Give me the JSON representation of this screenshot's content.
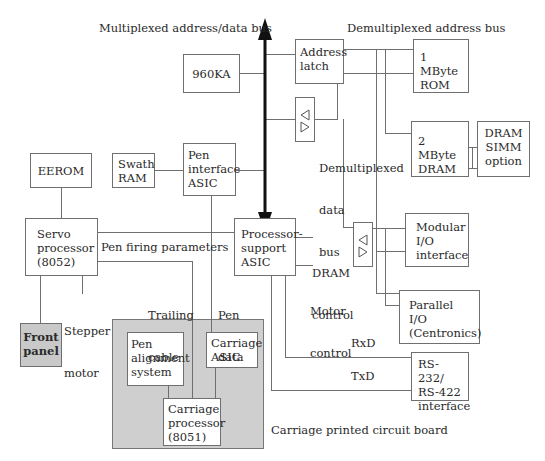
{
  "labels": {
    "mux_bus": "Multiplexed address/data bus",
    "demux_addr_bus": "Demultiplexed address bus",
    "demux_data_bus": [
      "Demultiplexed",
      "data",
      "bus"
    ],
    "pen_firing": "Pen firing parameters",
    "trailing_cable": [
      "Trailing",
      "cable"
    ],
    "pen_data": [
      "Pen",
      "data"
    ],
    "stepper_motor": [
      "Stepper",
      "motor"
    ],
    "dram_control": [
      "DRAM",
      "control"
    ],
    "motor_control": [
      "Motor",
      "control"
    ],
    "rxd": "RxD",
    "txd": "TxD",
    "carriage_pcb": "Carriage printed circuit board"
  },
  "blocks": {
    "cpu": [
      "960KA"
    ],
    "address_latch": [
      "Address",
      "latch"
    ],
    "rom": [
      "1 MByte",
      "ROM"
    ],
    "dram": [
      "2 MByte",
      "DRAM"
    ],
    "dram_simm": [
      "DRAM",
      "SIMM",
      "option"
    ],
    "eerom": [
      "EEROM"
    ],
    "swath_ram": [
      "Swath",
      "RAM"
    ],
    "pen_interface_asic": [
      "Pen",
      "interface",
      "ASIC"
    ],
    "servo_processor": [
      "Servo",
      "processor",
      "(8052)"
    ],
    "processor_support_asic": [
      "Processor-",
      "support",
      "ASIC"
    ],
    "modular_io": [
      "Modular",
      "I/O",
      "interface"
    ],
    "parallel_io": [
      "Parallel",
      "I/O",
      "(Centronics)"
    ],
    "rs232": [
      "RS-232/",
      "RS-422",
      "interface"
    ],
    "front_panel": [
      "Front",
      "panel"
    ],
    "pen_alignment": [
      "Pen",
      "alignment",
      "system"
    ],
    "carriage_asic": [
      "Carriage",
      "ASIC"
    ],
    "carriage_processor": [
      "Carriage",
      "processor",
      "(8051)"
    ]
  },
  "colors": {
    "line": "#6f6f6f",
    "bus": "#111111",
    "shaded_block": "#c9c9c9",
    "pcb_region": "#cfcfcf"
  }
}
